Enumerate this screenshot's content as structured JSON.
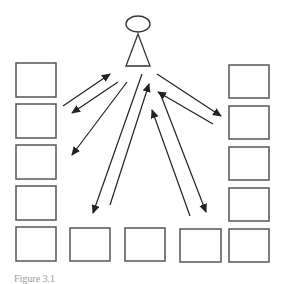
{
  "diagram": {
    "type": "communication-network",
    "colors": {
      "background": "#ffffff",
      "box_stroke": "#555555",
      "arrow_stroke": "#222222",
      "figure_stroke": "#333333"
    },
    "person": {
      "head": {
        "cx": 138,
        "cy": 24,
        "rx": 12,
        "ry": 8
      },
      "body": {
        "apex": [
          138,
          34
        ],
        "base_left": [
          126,
          66
        ],
        "base_right": [
          150,
          66
        ]
      }
    },
    "boxes": {
      "left_column": [
        {
          "x": 16,
          "y": 63,
          "w": 40,
          "h": 34
        },
        {
          "x": 16,
          "y": 104,
          "w": 40,
          "h": 34
        },
        {
          "x": 16,
          "y": 145,
          "w": 40,
          "h": 34
        },
        {
          "x": 16,
          "y": 186,
          "w": 40,
          "h": 34
        },
        {
          "x": 16,
          "y": 227,
          "w": 40,
          "h": 34
        }
      ],
      "right_column": [
        {
          "x": 229,
          "y": 65,
          "w": 40,
          "h": 33
        },
        {
          "x": 229,
          "y": 106,
          "w": 40,
          "h": 33
        },
        {
          "x": 229,
          "y": 147,
          "w": 40,
          "h": 33
        },
        {
          "x": 229,
          "y": 188,
          "w": 40,
          "h": 33
        },
        {
          "x": 229,
          "y": 229,
          "w": 40,
          "h": 33
        }
      ],
      "bottom_row": [
        {
          "x": 70,
          "y": 228,
          "w": 40,
          "h": 33
        },
        {
          "x": 125,
          "y": 228,
          "w": 40,
          "h": 33
        },
        {
          "x": 180,
          "y": 229,
          "w": 41,
          "h": 33
        }
      ]
    },
    "arrows": [
      {
        "from": [
          63,
          106
        ],
        "to": [
          110,
          74
        ],
        "direction": "toward-person"
      },
      {
        "from": [
          118,
          82
        ],
        "to": [
          72,
          113
        ],
        "direction": "away-from-person"
      },
      {
        "from": [
          127,
          82
        ],
        "to": [
          72,
          155
        ],
        "direction": "away-from-person"
      },
      {
        "from": [
          142,
          74
        ],
        "to": [
          93,
          213
        ],
        "direction": "away-from-person"
      },
      {
        "from": [
          110,
          205
        ],
        "to": [
          149,
          84
        ],
        "direction": "toward-person"
      },
      {
        "from": [
          157,
          74
        ],
        "to": [
          221,
          116
        ],
        "direction": "away-from-person"
      },
      {
        "from": [
          213,
          124
        ],
        "to": [
          158,
          92
        ],
        "direction": "toward-person"
      },
      {
        "from": [
          160,
          93
        ],
        "to": [
          206,
          212
        ],
        "direction": "away-from-person"
      },
      {
        "from": [
          190,
          216
        ],
        "to": [
          152,
          110
        ],
        "direction": "toward-person"
      }
    ],
    "caption": "Figure 3.1"
  }
}
